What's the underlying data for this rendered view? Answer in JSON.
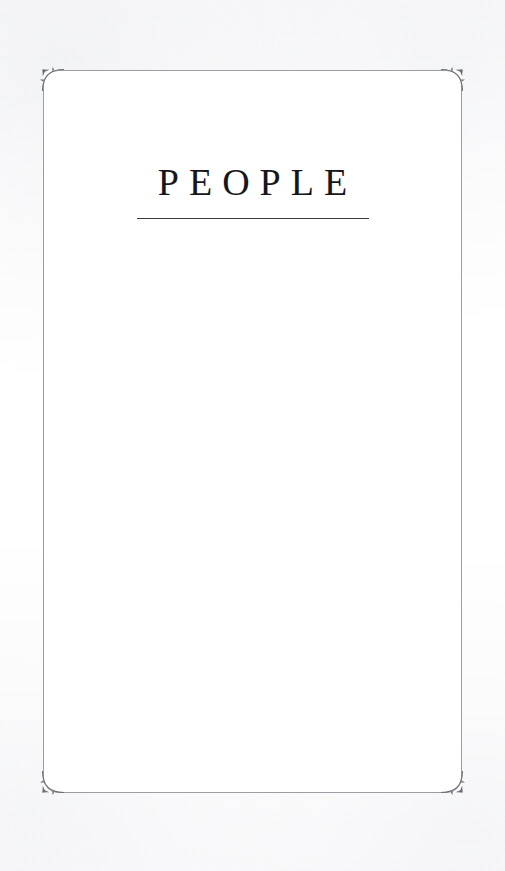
{
  "document": {
    "kind": "book-section-divider",
    "page_background": "#fdfdfe",
    "leaf_background": "#ffffff"
  },
  "frame": {
    "border_color": "#9b9da3",
    "corner_radius_px": 15,
    "ornament_color": "#6e7077",
    "ornaments": [
      {
        "name": "corner-ornament-top-left"
      },
      {
        "name": "corner-ornament-top-right"
      },
      {
        "name": "corner-ornament-bottom-left"
      },
      {
        "name": "corner-ornament-bottom-right"
      }
    ]
  },
  "title_block": {
    "title": "PEOPLE",
    "title_color": "#17171b",
    "rule_color": "#3a3a40",
    "rule_width_px": 232
  }
}
